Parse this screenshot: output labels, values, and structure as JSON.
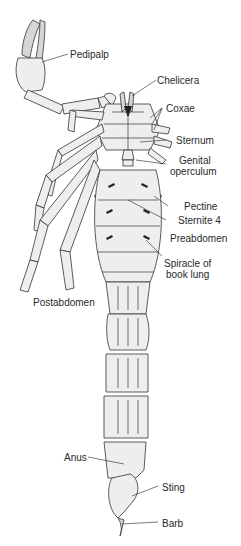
{
  "diagram": {
    "labels": {
      "pedipalp": "Pedipalp",
      "chelicera": "Chelicera",
      "coxae": "Coxae",
      "sternum": "Sternum",
      "genital_operculum_1": "Genital",
      "genital_operculum_2": "operculum",
      "pectine": "Pectine",
      "sternite4": "Sternite 4",
      "preabdomen": "Preabdomen",
      "spiracle_1": "Spiracle of",
      "spiracle_2": "book lung",
      "postabdomen": "Postabdomen",
      "anus": "Anus",
      "sting": "Sting",
      "barb": "Barb"
    },
    "colors": {
      "background": "#ffffff",
      "ink": "#2a2a2a",
      "fill": "#eeeeee"
    }
  }
}
